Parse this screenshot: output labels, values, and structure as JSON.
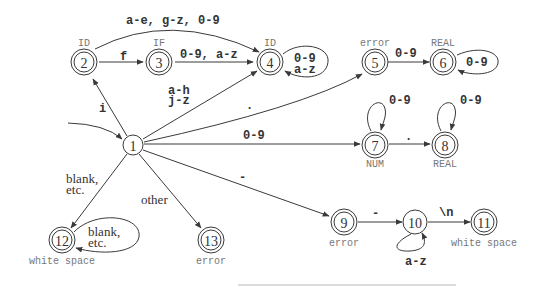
{
  "diagram": {
    "type": "DFA",
    "start_state": "1",
    "states": [
      {
        "id": "1",
        "label": "1",
        "accepting": false,
        "token": ""
      },
      {
        "id": "2",
        "label": "2",
        "accepting": true,
        "token": "ID"
      },
      {
        "id": "3",
        "label": "3",
        "accepting": true,
        "token": "IF"
      },
      {
        "id": "4",
        "label": "4",
        "accepting": true,
        "token": "ID"
      },
      {
        "id": "5",
        "label": "5",
        "accepting": true,
        "token": "error"
      },
      {
        "id": "6",
        "label": "6",
        "accepting": true,
        "token": "REAL"
      },
      {
        "id": "7",
        "label": "7",
        "accepting": true,
        "token": "NUM"
      },
      {
        "id": "8",
        "label": "8",
        "accepting": true,
        "token": "REAL"
      },
      {
        "id": "9",
        "label": "9",
        "accepting": true,
        "token": "error"
      },
      {
        "id": "10",
        "label": "10",
        "accepting": false,
        "token": ""
      },
      {
        "id": "11",
        "label": "11",
        "accepting": true,
        "token": "white space"
      },
      {
        "id": "12",
        "label": "12",
        "accepting": true,
        "token": "white space"
      },
      {
        "id": "13",
        "label": "13",
        "accepting": true,
        "token": "error"
      }
    ],
    "transitions": {
      "t1_2": {
        "from": "1",
        "to": "2",
        "label": "i"
      },
      "t2_3": {
        "from": "2",
        "to": "3",
        "label": "f"
      },
      "t2_4": {
        "from": "2",
        "to": "4",
        "label": "a-e, g-z, 0-9"
      },
      "t3_4": {
        "from": "3",
        "to": "4",
        "label": "0-9, a-z"
      },
      "t1_4": {
        "from": "1",
        "to": "4",
        "label_line1": "a-h",
        "label_line2": "j-z"
      },
      "t4_4": {
        "from": "4",
        "to": "4",
        "label_line1": "0-9",
        "label_line2": "a-z"
      },
      "t1_5": {
        "from": "1",
        "to": "5",
        "label": "."
      },
      "t5_6": {
        "from": "5",
        "to": "6",
        "label": "0-9"
      },
      "t6_6": {
        "from": "6",
        "to": "6",
        "label": "0-9"
      },
      "t1_7": {
        "from": "1",
        "to": "7",
        "label": "0-9"
      },
      "t7_7": {
        "from": "7",
        "to": "7",
        "label": "0-9"
      },
      "t7_8": {
        "from": "7",
        "to": "8",
        "label": "."
      },
      "t8_8": {
        "from": "8",
        "to": "8",
        "label": "0-9"
      },
      "t1_9": {
        "from": "1",
        "to": "9",
        "label": "-"
      },
      "t9_10": {
        "from": "9",
        "to": "10",
        "label": "-"
      },
      "t10_10": {
        "from": "10",
        "to": "10",
        "label": "a-z"
      },
      "t10_11": {
        "from": "10",
        "to": "11",
        "label": "\\n"
      },
      "t1_12": {
        "from": "1",
        "to": "12",
        "label_line1": "blank,",
        "label_line2": "etc."
      },
      "t12_12": {
        "from": "12",
        "to": "12",
        "label_line1": "blank,",
        "label_line2": "etc."
      },
      "t1_13": {
        "from": "1",
        "to": "13",
        "label": "other"
      }
    }
  }
}
